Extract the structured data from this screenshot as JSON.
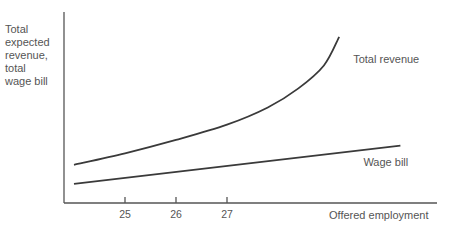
{
  "chart_data": {
    "type": "line",
    "title": "",
    "ylabel_lines": [
      "Total",
      "expected",
      "revenue,",
      "total",
      "wage bill"
    ],
    "xlabel": "Offered employment",
    "x_ticks": [
      "25",
      "26",
      "27"
    ],
    "x_tick_values": [
      25,
      26,
      27
    ],
    "xlim": [
      23.8,
      31.2
    ],
    "ylim": [
      0,
      100
    ],
    "grid": false,
    "series": [
      {
        "name": "Total revenue",
        "label": "Total revenue",
        "shape": "convex, rising increasingly steeply",
        "points": [
          [
            24.0,
            20
          ],
          [
            25.0,
            26
          ],
          [
            26.0,
            33
          ],
          [
            27.0,
            41
          ],
          [
            27.8,
            50
          ],
          [
            28.4,
            60
          ],
          [
            28.9,
            72
          ],
          [
            29.2,
            87
          ]
        ]
      },
      {
        "name": "Wage bill",
        "label": "Wage bill",
        "shape": "linear, rising",
        "points": [
          [
            24.0,
            10
          ],
          [
            30.4,
            30
          ]
        ]
      }
    ]
  }
}
